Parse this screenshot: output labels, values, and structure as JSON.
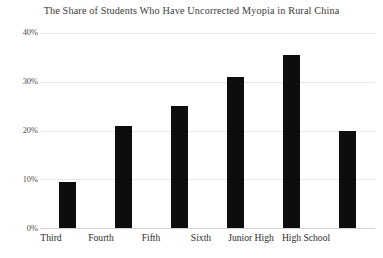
{
  "chart_data": {
    "type": "bar",
    "title": "The Share of Students Who Have Uncorrected Myopia in Rural China",
    "xlabel": "",
    "ylabel": "",
    "categories": [
      "Third",
      "Fourth",
      "Fifth",
      "Sixth",
      "Junior High",
      "High School"
    ],
    "values": [
      9.5,
      21,
      25,
      31,
      35.5,
      20
    ],
    "value_labels": [
      "9.5%",
      "21%",
      "25%",
      "31%",
      "35.5%",
      "20%"
    ],
    "ylim": [
      0,
      40
    ],
    "ytick_values": [
      0,
      10,
      20,
      30,
      40
    ],
    "ytick_labels": [
      "0%",
      "10%",
      "20%",
      "30%",
      "40%"
    ],
    "grid": true,
    "legend": false,
    "legend_position": "none",
    "series": [
      {
        "name": "Share with uncorrected myopia",
        "values": [
          9.5,
          21,
          25,
          31,
          35.5,
          20
        ]
      }
    ],
    "colors": {
      "bar": "#0d0d0d",
      "grid": "#e8e8e8",
      "baseline": "#d3d3d3",
      "title_text": "#3a3a3a",
      "tick_text": "#4d4d4d",
      "category_text": "#2b2b2b",
      "background": "#ffffff"
    }
  }
}
